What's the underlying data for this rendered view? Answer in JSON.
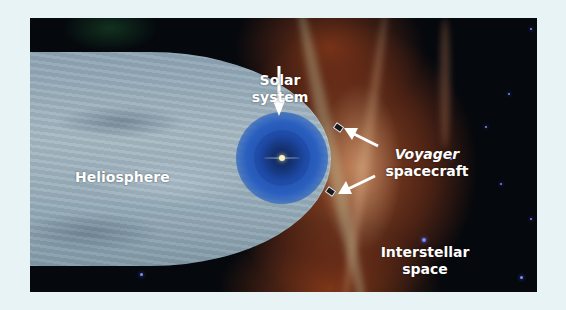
{
  "diagram": {
    "labels": {
      "heliosphere": "Heliosphere",
      "solar_system_line1": "Solar",
      "solar_system_line2": "system",
      "voyager_line1": "Voyager",
      "voyager_line2": "spacecraft",
      "interstellar_line1": "Interstellar",
      "interstellar_line2": "space"
    },
    "colors": {
      "background": "#e8f3f6",
      "space": "#05080d",
      "heliosphere": "#9fb3bf",
      "solar_bubble": "#2a5fc0",
      "interstellar_glow": "#a0502a",
      "label_text": "#ffffff"
    },
    "objects": [
      "heliosphere",
      "solar-system-bubble",
      "sun",
      "voyager-1",
      "voyager-2",
      "stars"
    ]
  }
}
